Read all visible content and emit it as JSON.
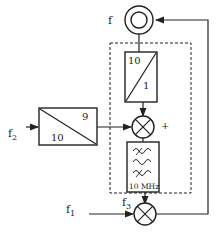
{
  "diagram": {
    "type": "frequency synthesizer block diagram",
    "labels": {
      "oscillator_output": "f",
      "input_f2": "f",
      "input_f2_sub": "2",
      "input_f1": "f",
      "input_f1_sub": "1",
      "mixer_output_f3": "f",
      "mixer_output_f3_sub": "3",
      "plus_sign": "+"
    },
    "blocks": {
      "divider_top": {
        "numerator": "10",
        "denominator": "1"
      },
      "divider_left": {
        "top": "9",
        "bottom": "10"
      },
      "filter": {
        "label": "10 MHz"
      }
    },
    "colors": {
      "stroke": "#222222",
      "background": "#ffffff"
    }
  }
}
